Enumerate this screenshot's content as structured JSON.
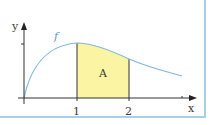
{
  "diagram": {
    "type": "area-under-curve",
    "labels": {
      "y_axis": "y",
      "x_axis": "x",
      "function": "f",
      "area": "A",
      "tick_1": "1",
      "tick_2": "2"
    },
    "colors": {
      "curve": "#7fb8dc",
      "area_fill": "#fbf5a3",
      "axis": "#333333",
      "frame": "#a9cfe6",
      "function_label": "#4a9bd1"
    },
    "interval": [
      1,
      2
    ]
  }
}
